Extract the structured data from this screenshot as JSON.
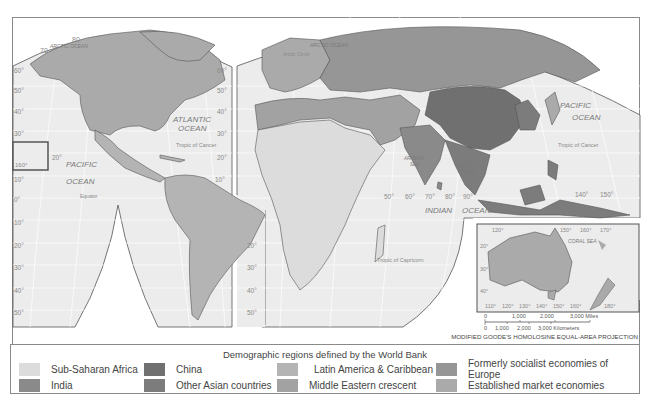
{
  "map": {
    "projection_label": "MODIFIED GOODE'S HOMOLOSINE EQUAL-AREA PROJECTION",
    "ocean_labels": {
      "arctic_ocean_left": "ARCTIC OCEAN",
      "arctic_ocean_right": "ARCTIC OCEAN",
      "atlantic_1": "ATLANTIC",
      "atlantic_2": "OCEAN",
      "pacific_left_1": "PACIFIC",
      "pacific_left_2": "OCEAN",
      "pacific_right_1": "PACIFIC",
      "pacific_right_2": "OCEAN",
      "indian_1": "INDIAN",
      "indian_2": "OCEAN",
      "arabian_sea_1": "ARABIAN",
      "arabian_sea_2": "SEA",
      "bay_of_bengal_1": "BAY OF",
      "bay_of_bengal_2": "BENGAL",
      "coral_sea": "CORAL SEA"
    },
    "line_labels": {
      "arctic_circle": "Arctic Circle",
      "tropic_cancer_left": "Tropic of Cancer",
      "tropic_cancer_right": "Tropic of Cancer",
      "tropic_capricorn": "Tropic of Capricorn",
      "equator": "Equator"
    },
    "lat_labels_left": [
      "60°",
      "50°",
      "40°",
      "30°",
      "20°",
      "10°",
      "0°",
      "10°",
      "20°",
      "30°",
      "40°",
      "50°"
    ],
    "lat_labels_mid": [
      "60°",
      "50°",
      "40°",
      "30°",
      "20°",
      "10°",
      "20°",
      "30°",
      "40°",
      "50°"
    ],
    "lon_labels_indian": [
      "50°",
      "60°",
      "70°",
      "80°",
      "90°"
    ],
    "lon_labels_pacific": [
      "140°",
      "150°"
    ],
    "inset_lon_top": [
      "120°",
      "150°",
      "160°",
      "170°"
    ],
    "inset_lon_bottom": [
      "110°",
      "120°",
      "130°",
      "140°",
      "150°",
      "160°",
      "180°"
    ],
    "inset_lat": [
      "20°",
      "30°",
      "40°"
    ],
    "hawaii_inset_label": "160°",
    "top_label_80": "80",
    "top_label_70": "70"
  },
  "scale": {
    "miles_ticks": [
      "0",
      "1,000",
      "2,000",
      "3,000 Miles"
    ],
    "km_ticks": [
      "0",
      "1,000",
      "2,000",
      "3,000 Kilometers"
    ]
  },
  "legend": {
    "title": "Demographic regions defined by the World Bank",
    "items": [
      {
        "label": "Sub-Saharan Africa",
        "color": "#dcdcdc"
      },
      {
        "label": "China",
        "color": "#707070"
      },
      {
        "label": "Latin America & Caribbean",
        "color": "#b4b4b4"
      },
      {
        "label": "Formerly socialist economies of Europe",
        "color": "#969696"
      },
      {
        "label": "India",
        "color": "#8a8a8a"
      },
      {
        "label": "Other Asian countries",
        "color": "#7c7c7c"
      },
      {
        "label": "Middle Eastern crescent",
        "color": "#a2a2a2"
      },
      {
        "label": "Established market economies",
        "color": "#aaaaaa"
      }
    ]
  },
  "colors": {
    "ocean": "#ececec",
    "graticule": "#ffffff",
    "frame": "#8a8a8a",
    "border": "#555555"
  }
}
